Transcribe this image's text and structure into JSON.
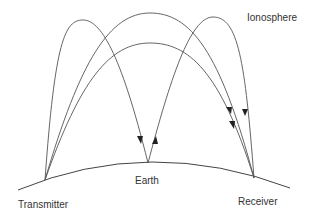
{
  "diagram": {
    "labels": {
      "ionosphere": "Ionosphere",
      "earth": "Earth",
      "transmitter": "Transmitter",
      "receiver": "Receiver"
    },
    "colors": {
      "line": "#444444",
      "text": "#333333",
      "background": "#ffffff"
    },
    "paths": [
      {
        "name": "single-hop-high",
        "from": "transmitter",
        "to": "receiver"
      },
      {
        "name": "single-hop-low",
        "from": "transmitter",
        "to": "receiver"
      },
      {
        "name": "two-hop-first",
        "from": "transmitter",
        "to": "earth"
      },
      {
        "name": "two-hop-second",
        "from": "earth",
        "to": "receiver"
      }
    ]
  }
}
